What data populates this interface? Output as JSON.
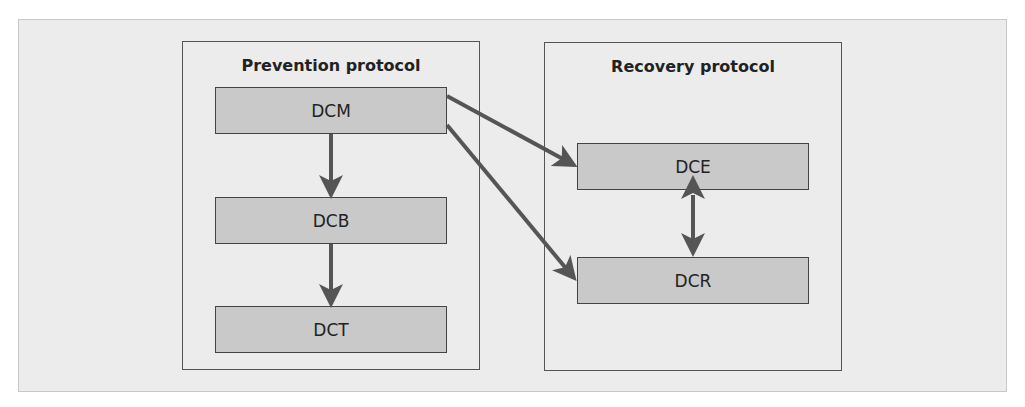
{
  "diagram": {
    "groups": [
      {
        "id": "prevention",
        "title": "Prevention protocol"
      },
      {
        "id": "recovery",
        "title": "Recovery protocol"
      }
    ],
    "nodes": [
      {
        "id": "DCM",
        "label": "DCM",
        "group": "prevention"
      },
      {
        "id": "DCB",
        "label": "DCB",
        "group": "prevention"
      },
      {
        "id": "DCT",
        "label": "DCT",
        "group": "prevention"
      },
      {
        "id": "DCE",
        "label": "DCE",
        "group": "recovery"
      },
      {
        "id": "DCR",
        "label": "DCR",
        "group": "recovery"
      }
    ],
    "edges": [
      {
        "from": "DCM",
        "to": "DCB",
        "type": "directed"
      },
      {
        "from": "DCB",
        "to": "DCT",
        "type": "directed"
      },
      {
        "from": "DCM",
        "to": "DCE",
        "type": "directed"
      },
      {
        "from": "DCM",
        "to": "DCR",
        "type": "directed"
      },
      {
        "from": "DCE",
        "to": "DCR",
        "type": "bidirectional"
      }
    ],
    "colors": {
      "node_fill": "#c9c9c9",
      "arrow": "#555555",
      "background": "#ececec"
    }
  }
}
